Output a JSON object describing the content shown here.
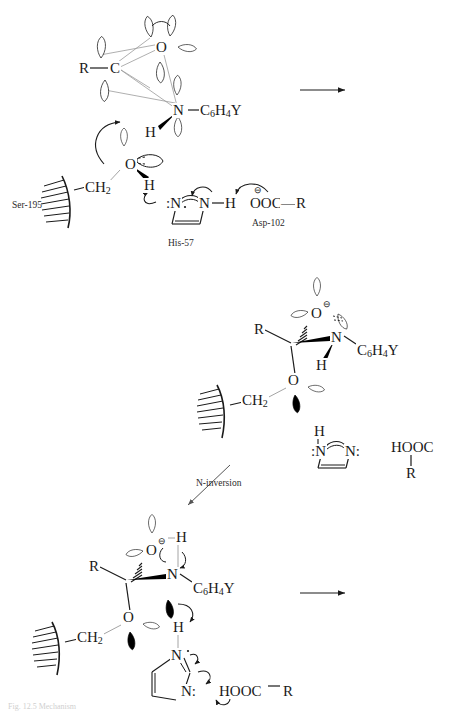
{
  "figure": {
    "kind": "reaction-mechanism-scheme",
    "caption": "Fig. 12.5  Mechanism"
  },
  "labels": {
    "ser": "Ser-195",
    "his": "His-57",
    "asp": "Asp-102",
    "n_inversion": "N-inversion"
  },
  "atoms": {
    "R": "R",
    "C": "C",
    "O": "O",
    "N": "N",
    "H": "H",
    "N_lone": ":N",
    "N_lone_right": "N:",
    "O_minus": "O",
    "charge_minus": "⊖",
    "aryl": "C",
    "aryl_6": "6",
    "aryl_H": "H",
    "aryl_4": "4",
    "aryl_Y": "Y",
    "ch2": "CH",
    "ch2_sub": "2",
    "carboxylate": "OOC",
    "carboxylic": "HOOC",
    "dash": "—"
  },
  "structures": {
    "top": {
      "name": "tetrahedral-intermediate-orbital",
      "R": "R",
      "C": "C",
      "O": "O",
      "N": "N",
      "H": "H",
      "aryl": "C6H4Y"
    },
    "middle": {
      "name": "alkoxide-intermediate",
      "R": "R",
      "O_minus": "O",
      "N": "N",
      "H": "H",
      "aryl": "C6H4Y",
      "O_ser": "O",
      "ch2": "CH2"
    },
    "bottom": {
      "name": "nitrogen-inverted-intermediate",
      "R": "R",
      "O_minus": "O",
      "OH_H": "H",
      "N": "N",
      "aryl": "C6H4Y",
      "O_ser": "O",
      "ch2": "CH2",
      "H_transfer": "H"
    }
  },
  "reagents": {
    "his_free_top_H": "H",
    "his_free_left": ":N",
    "his_free_right": "N:",
    "asp_acid": "HOOC",
    "asp_R": "R",
    "bottom_acid": "HOOC—R"
  },
  "arrows": {
    "top_right": "reaction-arrow-right",
    "bottom_right": "reaction-arrow-right",
    "inversion": "reaction-arrow-down-left"
  },
  "colors": {
    "ink": "#1a1a1a",
    "thin": "#8a8a8a",
    "lobe_fill": "#000000",
    "caption": "#cfcfcf"
  }
}
